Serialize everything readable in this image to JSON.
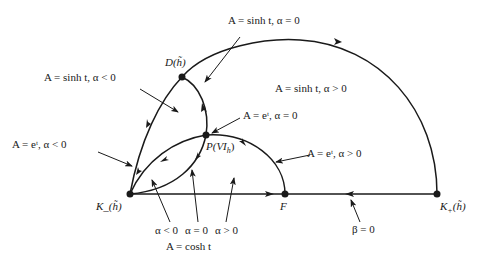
{
  "labels": {
    "top": "A = sinh t,  α = 0",
    "left_upper": "A = sinh t,  α < 0",
    "left_lower": "A = eᵗ,  α < 0",
    "right_upper": "A = sinh t,  α > 0",
    "mid_e0": "A = eᵗ,  α = 0",
    "mid_e_pos": "A = eᵗ,  α > 0",
    "alpha_neg": "α < 0",
    "alpha_zero": "α = 0",
    "alpha_pos": "α > 0",
    "cosh": "A = cosh t",
    "beta": "β = 0"
  },
  "points": {
    "D": "D(h̃)",
    "P": "P(VI",
    "P_sub": "h",
    "P_close": ")",
    "K_minus": "K_(h̃)",
    "K_plus": "K",
    "K_plus_sub": "+",
    "K_plus_tail": "(h̃)",
    "F": "F"
  },
  "colors": {
    "stroke": "#1a1a1a",
    "background": "#ffffff"
  }
}
